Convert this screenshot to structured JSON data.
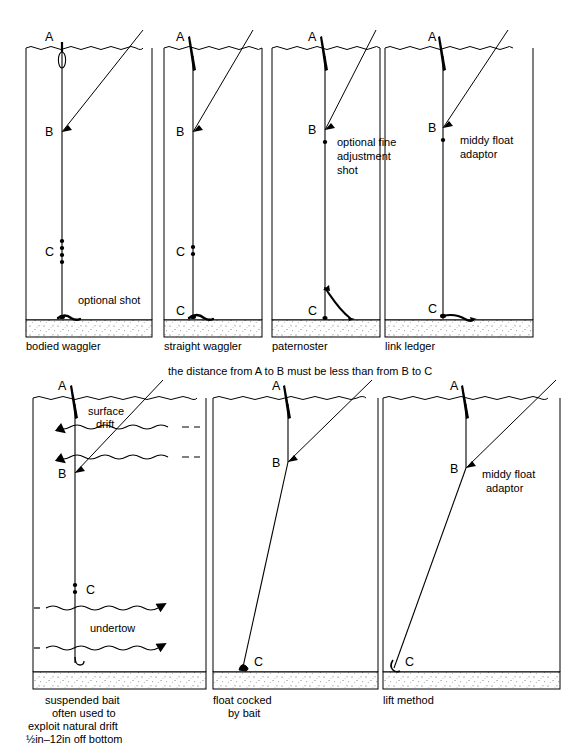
{
  "figure": {
    "middle_caption": "the distance from A to B must be less than from B to C",
    "point_labels": {
      "a": "A",
      "b": "B",
      "c": "C"
    },
    "colors": {
      "ink": "#000000",
      "water_line": "#000000",
      "bed_fill": "#ffffff",
      "bed_speckle": "#555555"
    }
  },
  "panels_top": [
    {
      "id": "bodied-waggler",
      "caption": "bodied waggler",
      "annotation": "optional shot",
      "points": [
        "A",
        "B",
        "C"
      ],
      "float_type": "bodied",
      "shot_count_at_c": 4,
      "terminal": "bait on bottom"
    },
    {
      "id": "straight-waggler",
      "caption": "straight waggler",
      "annotation": "",
      "points": [
        "A",
        "B",
        "C",
        "C"
      ],
      "float_type": "straight",
      "shot_count_at_c": 2,
      "terminal": "bait on bottom"
    },
    {
      "id": "paternoster",
      "caption": "paternoster",
      "annotation": "optional fine\nadjustment\nshot",
      "annotation_lines": [
        "optional fine",
        "adjustment",
        "shot"
      ],
      "points": [
        "A",
        "B",
        "C"
      ],
      "float_type": "straight",
      "shot_count_at_c": 1,
      "terminal": "curved dropper to bottom"
    },
    {
      "id": "link-ledger",
      "caption": "link ledger",
      "annotation": "middy float\nadaptor",
      "annotation_lines": [
        "middy float",
        "adaptor"
      ],
      "points": [
        "A",
        "B",
        "C"
      ],
      "float_type": "straight",
      "shot_count_at_c": 1,
      "terminal": "link ledger on bottom"
    }
  ],
  "panels_bottom": [
    {
      "id": "suspended-bait",
      "caption_lines": [
        "suspended bait",
        "often used to",
        "exploit natural drift",
        "½in–12in off bottom"
      ],
      "flow_labels": {
        "surface": "surface\ndrift",
        "surface_lines": [
          "surface",
          "drift"
        ],
        "under": "undertow"
      },
      "surface_arrow_direction": "left",
      "undertow_arrow_direction": "right",
      "surface_arrow_count": 2,
      "undertow_arrow_count": 2,
      "points": [
        "A",
        "B",
        "C"
      ],
      "shot_count_at_c": 2,
      "terminal": "suspended hook"
    },
    {
      "id": "float-cocked-by-bait",
      "caption_lines": [
        "float cocked",
        "by bait"
      ],
      "annotation": "",
      "points": [
        "A",
        "B",
        "C"
      ],
      "terminal": "bait resting on bottom"
    },
    {
      "id": "lift-method",
      "caption_lines": [
        "lift method"
      ],
      "annotation_lines": [
        "middy float",
        "adaptor"
      ],
      "points": [
        "A",
        "B",
        "C"
      ],
      "terminal": "shot on bottom"
    }
  ]
}
